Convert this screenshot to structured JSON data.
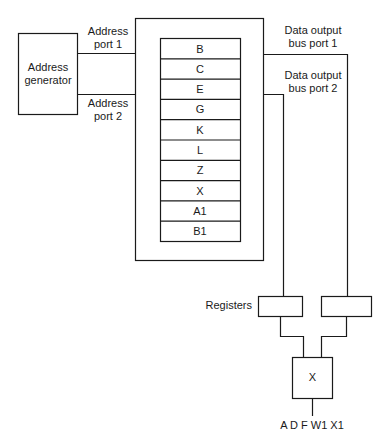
{
  "diagram": {
    "address_generator": {
      "line1": "Address",
      "line2": "generator"
    },
    "address_port_1": {
      "line1": "Address",
      "line2": "port 1"
    },
    "address_port_2": {
      "line1": "Address",
      "line2": "port 2"
    },
    "data_bus_1": {
      "line1": "Data output",
      "line2": "bus port 1"
    },
    "data_bus_2": {
      "line1": "Data output",
      "line2": "bus port 2"
    },
    "memory_cells": [
      "B",
      "C",
      "E",
      "G",
      "K",
      "L",
      "Z",
      "X",
      "A1",
      "B1"
    ],
    "registers_label": "Registers",
    "operator": "X",
    "output_label": "A D F W1 X1"
  },
  "colors": {
    "line": "#1a1a1a",
    "background": "#ffffff"
  }
}
